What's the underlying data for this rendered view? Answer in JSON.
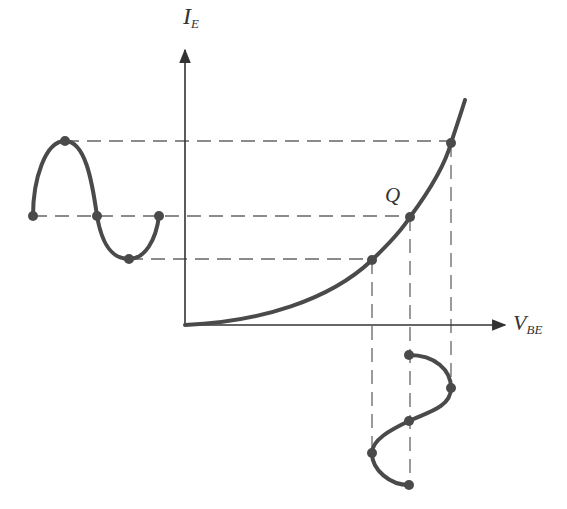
{
  "diagram": {
    "type": "transistor input characteristic with ac signal mapping",
    "axes": {
      "y_axis": {
        "label_main": "I",
        "label_sub": "E"
      },
      "x_axis": {
        "label_main": "V",
        "label_sub": "BE"
      }
    },
    "operating_point": {
      "label": "Q"
    },
    "colors": {
      "curve": "#4a4a4a",
      "axes": "#333333",
      "dashes": "#555555",
      "background": "#ffffff"
    },
    "curve": {
      "description": "exponential I_E vs V_BE characteristic",
      "points": [
        [
          185,
          325
        ],
        [
          250,
          318
        ],
        [
          320,
          293
        ],
        [
          372,
          260
        ],
        [
          410,
          217
        ],
        [
          451,
          143
        ],
        [
          465,
          100
        ]
      ]
    },
    "input_waveform": {
      "description": "sinusoidal V_BE variation (vertical, below x-axis)",
      "markers": [
        [
          409,
          355
        ],
        [
          451,
          388
        ],
        [
          409,
          421
        ],
        [
          372,
          453
        ],
        [
          409,
          485
        ]
      ]
    },
    "output_waveform": {
      "description": "sinusoidal I_E variation (horizontal, left of y-axis)",
      "markers": [
        [
          33,
          216
        ],
        [
          65,
          141
        ],
        [
          97,
          216
        ],
        [
          129,
          259
        ],
        [
          159,
          216
        ]
      ]
    },
    "curve_markers": [
      [
        372,
        260
      ],
      [
        410,
        217
      ],
      [
        451,
        143
      ]
    ]
  }
}
